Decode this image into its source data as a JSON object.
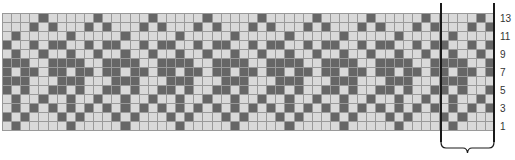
{
  "chart": {
    "type": "knitting-colorwork-chart",
    "columns": 54,
    "rows": 13,
    "repeat_width": 6,
    "colors": {
      "light": "#d9d9d9",
      "dark": "#666666",
      "grid": "#9a9a9a",
      "line": "#1a1a1a"
    },
    "motif_top_to_bottom": [
      [
        0,
        0,
        0,
        0,
        1,
        0
      ],
      [
        0,
        0,
        0,
        1,
        0,
        1
      ],
      [
        0,
        1,
        0,
        0,
        0,
        0
      ],
      [
        1,
        0,
        0,
        1,
        0,
        1
      ],
      [
        0,
        1,
        0,
        0,
        1,
        0
      ],
      [
        1,
        1,
        1,
        0,
        0,
        1
      ],
      [
        1,
        0,
        1,
        1,
        0,
        1
      ],
      [
        1,
        1,
        1,
        0,
        0,
        0
      ],
      [
        1,
        0,
        1,
        0,
        0,
        1
      ],
      [
        0,
        1,
        0,
        0,
        1,
        0
      ],
      [
        0,
        1,
        0,
        1,
        0,
        1
      ],
      [
        1,
        0,
        1,
        0,
        0,
        0
      ],
      [
        0,
        1,
        0,
        0,
        0,
        0
      ]
    ]
  },
  "row_labels": [
    {
      "text": "13",
      "y": 14
    },
    {
      "text": "11",
      "y": 32
    },
    {
      "text": "9",
      "y": 50
    },
    {
      "text": "7",
      "y": 68
    },
    {
      "text": "5",
      "y": 86
    },
    {
      "text": "3",
      "y": 104
    },
    {
      "text": "1",
      "y": 122
    }
  ]
}
